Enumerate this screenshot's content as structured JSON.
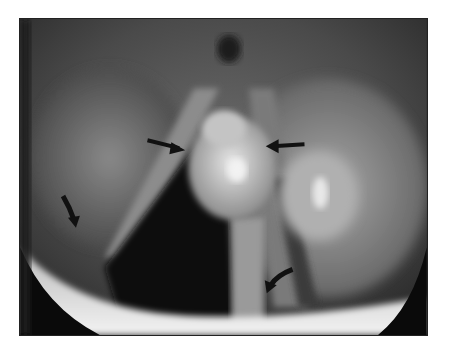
{
  "figure": {
    "type": "grayscale endoscopic laryngoscopy image",
    "background": "#ffffff",
    "frame": {
      "x": 19,
      "y": 18,
      "width": 409,
      "height": 318
    },
    "annotations": [
      {
        "name": "straight-arrow-left",
        "direction": "pointing right",
        "position": [
          160,
          150
        ]
      },
      {
        "name": "straight-arrow-right",
        "direction": "pointing left",
        "position": [
          280,
          146
        ]
      },
      {
        "name": "curved-arrow-lower-left",
        "direction": "pointing down",
        "position": [
          70,
          215
        ]
      },
      {
        "name": "curved-arrow-lower-right",
        "direction": "pointing down-left",
        "position": [
          280,
          280
        ]
      }
    ],
    "colors": {
      "arrow": "#111111",
      "lesion": "#bdbdbd",
      "airway": "#0d0d0d"
    }
  }
}
